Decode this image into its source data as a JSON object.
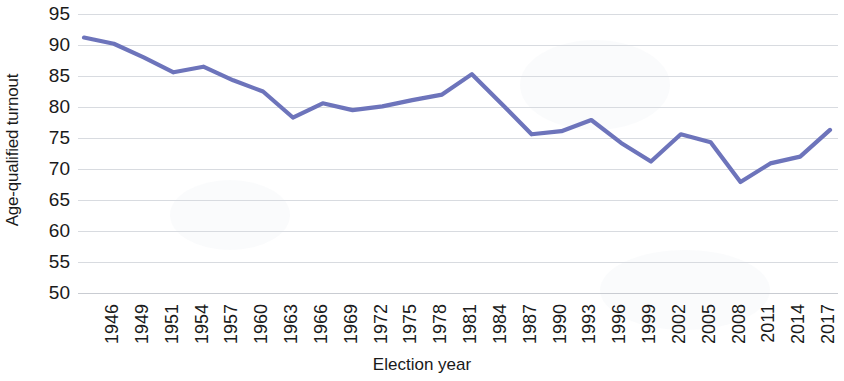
{
  "chart_data": {
    "type": "line",
    "title": "",
    "xlabel": "Election year",
    "ylabel": "Age-qualified turnout",
    "ylim": [
      50,
      95
    ],
    "y_ticks": [
      95,
      90,
      85,
      80,
      75,
      70,
      65,
      60,
      55,
      50
    ],
    "grid": true,
    "legend": "none",
    "line_color": "#6d74bb",
    "categories": [
      "1946",
      "1949",
      "1951",
      "1954",
      "1957",
      "1960",
      "1963",
      "1966",
      "1969",
      "1972",
      "1975",
      "1978",
      "1981",
      "1984",
      "1987",
      "1990",
      "1993",
      "1996",
      "1999",
      "2002",
      "2005",
      "2008",
      "2011",
      "2014",
      "2017",
      "2020"
    ],
    "values": [
      91.2,
      90.2,
      88.0,
      85.6,
      86.5,
      84.3,
      82.5,
      78.3,
      80.6,
      79.5,
      80.1,
      81.1,
      82.0,
      85.3,
      80.5,
      75.6,
      76.1,
      77.9,
      74.2,
      71.2,
      75.6,
      74.3,
      67.9,
      70.9,
      72.0,
      76.3
    ],
    "series": [
      {
        "name": "Age-qualified turnout",
        "values": [
          91.2,
          90.2,
          88.0,
          85.6,
          86.5,
          84.3,
          82.5,
          78.3,
          80.6,
          79.5,
          80.1,
          81.1,
          82.0,
          85.3,
          80.5,
          75.6,
          76.1,
          77.9,
          74.2,
          71.2,
          75.6,
          74.3,
          67.9,
          70.9,
          72.0,
          76.3
        ]
      }
    ]
  },
  "axes": {
    "y_title": "Age-qualified turnout",
    "x_title": "Election year"
  }
}
